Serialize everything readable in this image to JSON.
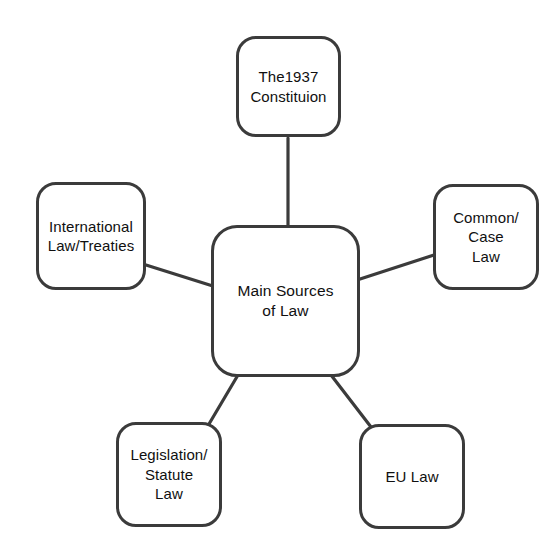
{
  "diagram": {
    "type": "mind-map",
    "title": "Main Sources of Law",
    "background_color": "#ffffff",
    "node_border_color": "#3b3b3b",
    "node_fill_color": "#ffffff",
    "edge_color": "#3b3b3b",
    "text_color": "#101010",
    "center": {
      "id": "main-sources-of-law",
      "label": "Main Sources\nof Law"
    },
    "branches": [
      {
        "id": "the-1937-constitution",
        "label": "The1937\nConstituion",
        "position": "top"
      },
      {
        "id": "international-law-treaties",
        "label": "International\nLaw/Treaties",
        "position": "left"
      },
      {
        "id": "common-case-law",
        "label": "Common/\nCase\nLaw",
        "position": "right"
      },
      {
        "id": "legislation-statute-law",
        "label": "Legislation/\nStatute\nLaw",
        "position": "bottom-left"
      },
      {
        "id": "eu-law",
        "label": "EU Law",
        "position": "bottom-right"
      }
    ],
    "edges": [
      {
        "from": "main-sources-of-law",
        "to": "the-1937-constitution"
      },
      {
        "from": "main-sources-of-law",
        "to": "international-law-treaties"
      },
      {
        "from": "main-sources-of-law",
        "to": "common-case-law"
      },
      {
        "from": "main-sources-of-law",
        "to": "legislation-statute-law"
      },
      {
        "from": "main-sources-of-law",
        "to": "eu-law"
      }
    ]
  }
}
